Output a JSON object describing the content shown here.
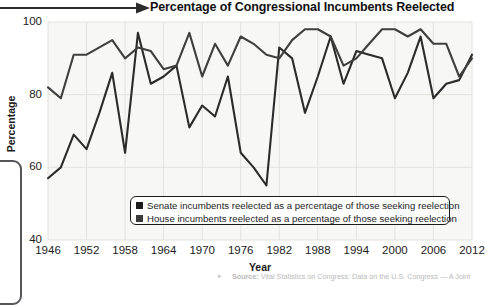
{
  "title": "Percentage of Congressional Incumbents Reelected",
  "axis": {
    "ylabel": "Percentage",
    "xlabel": "Year",
    "yticks": [
      "40",
      "60",
      "80",
      "100"
    ],
    "xticks": [
      "1946",
      "1952",
      "1958",
      "1964",
      "1970",
      "1976",
      "1982",
      "1988",
      "1994",
      "2000",
      "2006",
      "2012"
    ]
  },
  "legend": {
    "items": [
      {
        "swatch_color": "#1b1b1b",
        "label": "Senate incumbents reelected as a percentage of those seeking reelection"
      },
      {
        "swatch_color": "#3a3a3a",
        "label": "House incumbents reelected as a percentage of those seeking reelection"
      }
    ]
  },
  "source": {
    "label": "Source:",
    "text": " Vital Statistics on Congress: Data on the U.S. Congress — A Joint"
  },
  "colors": {
    "senate_line": "#2b2b2b",
    "house_line": "#3f3f3f",
    "plot_background": "#f7f7f5",
    "gridline": "#e2e2de",
    "text": "#1b1b1b"
  },
  "chart_data": {
    "type": "line",
    "title": "Percentage of Congressional Incumbents Reelected",
    "xlabel": "Year",
    "ylabel": "Percentage",
    "xlim": [
      1946,
      2012
    ],
    "ylim": [
      40,
      100
    ],
    "grid": true,
    "legend_position": "bottom-center",
    "x": [
      1946,
      1948,
      1950,
      1952,
      1954,
      1956,
      1958,
      1960,
      1962,
      1964,
      1966,
      1968,
      1970,
      1972,
      1974,
      1976,
      1978,
      1980,
      1982,
      1984,
      1986,
      1988,
      1990,
      1992,
      1994,
      1996,
      1998,
      2000,
      2002,
      2004,
      2006,
      2008,
      2010,
      2012
    ],
    "series": [
      {
        "name": "Senate incumbents reelected as a percentage of those seeking reelection",
        "color": "#2b2b2b",
        "values": [
          57,
          60,
          69,
          65,
          75,
          86,
          64,
          97,
          83,
          85,
          88,
          71,
          77,
          74,
          85,
          64,
          60,
          55,
          93,
          90,
          75,
          85,
          96,
          83,
          92,
          91,
          90,
          79,
          86,
          96,
          79,
          83,
          84,
          91
        ]
      },
      {
        "name": "House incumbents reelected as a percentage of those seeking reelection",
        "color": "#3f3f3f",
        "values": [
          82,
          79,
          91,
          91,
          93,
          95,
          90,
          93,
          92,
          87,
          88,
          97,
          85,
          94,
          88,
          96,
          94,
          91,
          90,
          95,
          98,
          98,
          96,
          88,
          90,
          94,
          98,
          98,
          96,
          98,
          94,
          94,
          85,
          90
        ]
      }
    ]
  }
}
